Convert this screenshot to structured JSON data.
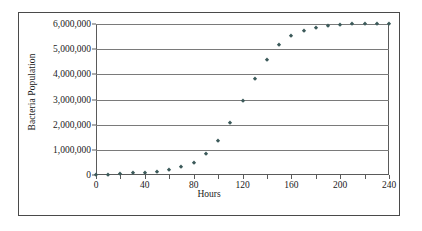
{
  "chart_data": {
    "type": "scatter",
    "title": "",
    "xlabel": "Hours",
    "ylabel": "Bacteria Population",
    "xlim": [
      0,
      240
    ],
    "ylim": [
      0,
      6000000
    ],
    "grid": true,
    "legend": null,
    "marker_color": "#3c5a5a",
    "x_ticks": [
      0,
      20,
      40,
      60,
      80,
      100,
      120,
      140,
      160,
      180,
      200,
      220,
      240
    ],
    "x_tick_labels": [
      "0",
      "",
      "40",
      "",
      "80",
      "",
      "120",
      "",
      "160",
      "",
      "200",
      "",
      "240"
    ],
    "y_ticks": [
      0,
      1000000,
      2000000,
      3000000,
      4000000,
      5000000,
      6000000
    ],
    "y_tick_labels": [
      "0",
      "1,000,000",
      "2,000,000",
      "3,000,000",
      "4,000,000",
      "5,000,000",
      "6,000,000"
    ],
    "x": [
      0,
      10,
      20,
      30,
      40,
      50,
      60,
      70,
      80,
      90,
      100,
      110,
      120,
      130,
      140,
      150,
      160,
      170,
      180,
      190,
      200,
      210,
      220,
      230,
      240
    ],
    "values": [
      5000,
      12000,
      30000,
      60000,
      75000,
      110000,
      185000,
      300000,
      490000,
      840000,
      1350000,
      2060000,
      2930000,
      3800000,
      4550000,
      5150000,
      5510000,
      5720000,
      5860000,
      5930000,
      5980000,
      5990000,
      6000000,
      6000000,
      6000000
    ],
    "series": [
      {
        "name": "Bacteria Population",
        "values": [
          5000,
          12000,
          30000,
          60000,
          75000,
          110000,
          185000,
          300000,
          490000,
          840000,
          1350000,
          2060000,
          2930000,
          3800000,
          4550000,
          5150000,
          5510000,
          5720000,
          5860000,
          5930000,
          5980000,
          5990000,
          6000000,
          6000000,
          6000000
        ]
      }
    ]
  }
}
